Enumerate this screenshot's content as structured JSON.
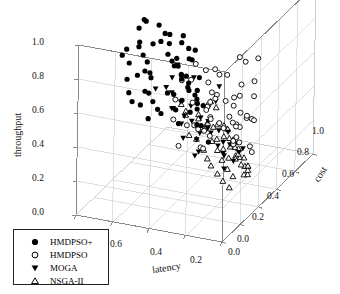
{
  "figure": {
    "type": "3d-scatter",
    "background": "#ffffff",
    "frame_color": "#8a8a8a",
    "point_color": "#000000"
  },
  "axes": {
    "y": {
      "label": "throughput",
      "ticks": [
        "0.0",
        "0.2",
        "0.4",
        "0.6",
        "0.8",
        "1.0"
      ],
      "range": [
        0,
        1
      ]
    },
    "x": {
      "label": "latency",
      "ticks": [
        "0.8",
        "0.6",
        "0.4",
        "0.2",
        "0.0"
      ],
      "range": [
        0,
        0.8
      ],
      "direction": "descending-left-to-right"
    },
    "z": {
      "label": "cost",
      "ticks": [
        "0.0",
        "0.2",
        "0.4",
        "0.6",
        "0.8",
        "1.0"
      ],
      "range": [
        0,
        1
      ]
    }
  },
  "legend": {
    "items": [
      {
        "label": "HMDPSO+",
        "marker": "filled-circle"
      },
      {
        "label": "HMDPSO",
        "marker": "open-circle"
      },
      {
        "label": "MOGA",
        "marker": "filled-triangle-down"
      },
      {
        "label": "NSGA-II",
        "marker": "open-triangle-up"
      }
    ]
  },
  "chart_data": {
    "type": "scatter",
    "title": "",
    "xlabel": "latency",
    "ylabel": "throughput",
    "zlabel": "cost",
    "xlim": [
      0,
      0.8
    ],
    "ylim": [
      0,
      1
    ],
    "zlim": [
      0,
      1
    ],
    "grid": true,
    "legend_position": "lower-left",
    "series": [
      {
        "name": "HMDPSO+",
        "marker": "filled-circle",
        "points": [
          [
            0.62,
            0.98,
            0.3
          ],
          [
            0.55,
            0.97,
            0.38
          ],
          [
            0.48,
            0.95,
            0.26
          ],
          [
            0.66,
            0.93,
            0.46
          ],
          [
            0.58,
            0.92,
            0.22
          ],
          [
            0.41,
            0.91,
            0.35
          ],
          [
            0.7,
            0.9,
            0.52
          ],
          [
            0.52,
            0.89,
            0.44
          ],
          [
            0.63,
            0.88,
            0.33
          ],
          [
            0.45,
            0.87,
            0.28
          ],
          [
            0.57,
            0.86,
            0.49
          ],
          [
            0.36,
            0.85,
            0.4
          ],
          [
            0.68,
            0.84,
            0.24
          ],
          [
            0.5,
            0.83,
            0.55
          ],
          [
            0.6,
            0.82,
            0.31
          ],
          [
            0.43,
            0.81,
            0.47
          ],
          [
            0.72,
            0.8,
            0.37
          ],
          [
            0.54,
            0.79,
            0.21
          ],
          [
            0.64,
            0.78,
            0.5
          ],
          [
            0.47,
            0.77,
            0.42
          ],
          [
            0.38,
            0.76,
            0.29
          ],
          [
            0.59,
            0.75,
            0.58
          ],
          [
            0.69,
            0.74,
            0.34
          ],
          [
            0.51,
            0.73,
            0.45
          ],
          [
            0.61,
            0.72,
            0.27
          ],
          [
            0.44,
            0.71,
            0.53
          ],
          [
            0.33,
            0.7,
            0.39
          ],
          [
            0.56,
            0.69,
            0.32
          ],
          [
            0.66,
            0.68,
            0.48
          ],
          [
            0.49,
            0.67,
            0.6
          ],
          [
            0.4,
            0.66,
            0.25
          ],
          [
            0.62,
            0.65,
            0.43
          ],
          [
            0.53,
            0.64,
            0.56
          ],
          [
            0.71,
            0.63,
            0.36
          ],
          [
            0.46,
            0.62,
            0.51
          ],
          [
            0.35,
            0.61,
            0.41
          ],
          [
            0.58,
            0.6,
            0.62
          ],
          [
            0.67,
            0.59,
            0.3
          ],
          [
            0.5,
            0.58,
            0.54
          ],
          [
            0.42,
            0.57,
            0.46
          ],
          [
            0.6,
            0.56,
            0.38
          ],
          [
            0.31,
            0.55,
            0.33
          ],
          [
            0.55,
            0.54,
            0.64
          ],
          [
            0.65,
            0.53,
            0.44
          ],
          [
            0.48,
            0.52,
            0.57
          ],
          [
            0.39,
            0.51,
            0.49
          ],
          [
            0.63,
            0.5,
            0.35
          ],
          [
            0.52,
            0.49,
            0.66
          ],
          [
            0.7,
            0.48,
            0.4
          ],
          [
            0.45,
            0.47,
            0.59
          ],
          [
            0.37,
            0.46,
            0.52
          ],
          [
            0.57,
            0.45,
            0.42
          ],
          [
            0.28,
            0.62,
            0.27
          ],
          [
            0.3,
            0.47,
            0.31
          ],
          [
            0.61,
            0.44,
            0.61
          ],
          [
            0.5,
            0.43,
            0.48
          ],
          [
            0.43,
            0.42,
            0.37
          ],
          [
            0.66,
            0.41,
            0.55
          ],
          [
            0.54,
            0.4,
            0.63
          ],
          [
            0.34,
            0.39,
            0.44
          ],
          [
            0.59,
            0.38,
            0.5
          ],
          [
            0.47,
            0.37,
            0.58
          ],
          [
            0.26,
            0.35,
            0.36
          ],
          [
            0.64,
            0.36,
            0.46
          ]
        ]
      },
      {
        "name": "HMDPSO",
        "marker": "open-circle",
        "points": [
          [
            0.24,
            0.64,
            0.72
          ],
          [
            0.31,
            0.58,
            0.66
          ],
          [
            0.2,
            0.52,
            0.58
          ],
          [
            0.27,
            0.49,
            0.74
          ],
          [
            0.35,
            0.47,
            0.63
          ],
          [
            0.18,
            0.44,
            0.55
          ],
          [
            0.29,
            0.43,
            0.7
          ],
          [
            0.38,
            0.42,
            0.6
          ],
          [
            0.22,
            0.41,
            0.78
          ],
          [
            0.33,
            0.4,
            0.52
          ],
          [
            0.41,
            0.39,
            0.68
          ],
          [
            0.26,
            0.38,
            0.59
          ],
          [
            0.36,
            0.37,
            0.75
          ],
          [
            0.19,
            0.36,
            0.64
          ],
          [
            0.3,
            0.35,
            0.56
          ],
          [
            0.44,
            0.34,
            0.71
          ],
          [
            0.23,
            0.33,
            0.61
          ],
          [
            0.34,
            0.32,
            0.8
          ],
          [
            0.4,
            0.31,
            0.53
          ],
          [
            0.28,
            0.3,
            0.67
          ],
          [
            0.47,
            0.29,
            0.76
          ],
          [
            0.21,
            0.28,
            0.57
          ],
          [
            0.32,
            0.27,
            0.65
          ],
          [
            0.43,
            0.26,
            0.73
          ],
          [
            0.25,
            0.25,
            0.82
          ],
          [
            0.37,
            0.24,
            0.6
          ],
          [
            0.5,
            0.23,
            0.69
          ],
          [
            0.29,
            0.22,
            0.77
          ],
          [
            0.16,
            0.21,
            0.62
          ],
          [
            0.39,
            0.2,
            0.54
          ],
          [
            0.46,
            0.19,
            0.72
          ],
          [
            0.27,
            0.18,
            0.66
          ],
          [
            0.35,
            0.17,
            0.85
          ],
          [
            0.53,
            0.16,
            0.58
          ],
          [
            0.31,
            0.15,
            0.74
          ],
          [
            0.42,
            0.14,
            0.63
          ],
          [
            0.12,
            0.46,
            0.5
          ],
          [
            0.14,
            0.32,
            0.46
          ],
          [
            0.1,
            0.24,
            0.52
          ],
          [
            0.48,
            0.35,
            0.84
          ],
          [
            0.56,
            0.3,
            0.79
          ],
          [
            0.6,
            0.26,
            0.66
          ],
          [
            0.52,
            0.38,
            0.88
          ],
          [
            0.45,
            0.45,
            0.86
          ],
          [
            0.58,
            0.42,
            0.81
          ],
          [
            0.63,
            0.33,
            0.74
          ],
          [
            0.49,
            0.28,
            0.9
          ],
          [
            0.55,
            0.21,
            0.71
          ],
          [
            0.17,
            0.56,
            0.68
          ],
          [
            0.13,
            0.38,
            0.6
          ],
          [
            0.66,
            0.37,
            0.87
          ],
          [
            0.61,
            0.45,
            0.92
          ],
          [
            0.23,
            0.6,
            0.84
          ],
          [
            0.36,
            0.55,
            0.9
          ],
          [
            0.44,
            0.52,
            0.79
          ],
          [
            0.51,
            0.48,
            0.83
          ]
        ]
      },
      {
        "name": "MOGA",
        "marker": "filled-triangle-down",
        "points": [
          [
            0.7,
            0.42,
            0.66
          ],
          [
            0.64,
            0.38,
            0.72
          ],
          [
            0.58,
            0.36,
            0.6
          ],
          [
            0.52,
            0.34,
            0.69
          ],
          [
            0.46,
            0.32,
            0.58
          ],
          [
            0.4,
            0.3,
            0.64
          ],
          [
            0.34,
            0.29,
            0.55
          ],
          [
            0.28,
            0.27,
            0.62
          ],
          [
            0.22,
            0.26,
            0.52
          ],
          [
            0.61,
            0.31,
            0.76
          ],
          [
            0.55,
            0.28,
            0.68
          ],
          [
            0.49,
            0.25,
            0.74
          ],
          [
            0.43,
            0.24,
            0.61
          ],
          [
            0.37,
            0.22,
            0.7
          ],
          [
            0.31,
            0.21,
            0.57
          ],
          [
            0.25,
            0.19,
            0.66
          ],
          [
            0.19,
            0.18,
            0.5
          ],
          [
            0.67,
            0.24,
            0.8
          ],
          [
            0.59,
            0.2,
            0.73
          ],
          [
            0.53,
            0.18,
            0.63
          ],
          [
            0.47,
            0.17,
            0.78
          ],
          [
            0.41,
            0.16,
            0.56
          ],
          [
            0.35,
            0.15,
            0.71
          ],
          [
            0.29,
            0.14,
            0.6
          ],
          [
            0.73,
            0.33,
            0.84
          ],
          [
            0.69,
            0.45,
            0.88
          ],
          [
            0.63,
            0.48,
            0.7
          ],
          [
            0.57,
            0.43,
            0.82
          ],
          [
            0.15,
            0.25,
            0.48
          ],
          [
            0.11,
            0.3,
            0.44
          ],
          [
            0.45,
            0.38,
            0.86
          ],
          [
            0.38,
            0.4,
            0.68
          ],
          [
            0.5,
            0.13,
            0.72
          ],
          [
            0.44,
            0.12,
            0.58
          ],
          [
            0.33,
            0.11,
            0.67
          ],
          [
            0.26,
            0.1,
            0.54
          ]
        ]
      },
      {
        "name": "NSGA-II",
        "marker": "open-triangle-up",
        "points": [
          [
            0.4,
            0.14,
            0.86
          ],
          [
            0.34,
            0.12,
            0.8
          ],
          [
            0.28,
            0.11,
            0.74
          ],
          [
            0.22,
            0.1,
            0.68
          ],
          [
            0.17,
            0.09,
            0.62
          ],
          [
            0.45,
            0.12,
            0.92
          ],
          [
            0.38,
            0.1,
            0.84
          ],
          [
            0.32,
            0.09,
            0.78
          ],
          [
            0.26,
            0.08,
            0.71
          ],
          [
            0.2,
            0.07,
            0.65
          ],
          [
            0.5,
            0.1,
            0.95
          ],
          [
            0.43,
            0.08,
            0.88
          ],
          [
            0.36,
            0.07,
            0.81
          ],
          [
            0.3,
            0.06,
            0.75
          ],
          [
            0.24,
            0.05,
            0.69
          ],
          [
            0.18,
            0.05,
            0.6
          ],
          [
            0.55,
            0.09,
            0.9
          ],
          [
            0.47,
            0.07,
            0.83
          ],
          [
            0.41,
            0.06,
            0.77
          ],
          [
            0.35,
            0.05,
            0.7
          ],
          [
            0.29,
            0.04,
            0.64
          ],
          [
            0.23,
            0.04,
            0.58
          ],
          [
            0.6,
            0.12,
            0.94
          ],
          [
            0.52,
            0.14,
            0.87
          ],
          [
            0.14,
            0.08,
            0.56
          ],
          [
            0.12,
            0.13,
            0.52
          ],
          [
            0.1,
            0.18,
            0.48
          ],
          [
            0.58,
            0.17,
            0.9
          ],
          [
            0.63,
            0.2,
            0.86
          ],
          [
            0.48,
            0.19,
            0.8
          ],
          [
            0.42,
            0.21,
            0.74
          ],
          [
            0.37,
            0.18,
            0.68
          ],
          [
            0.31,
            0.16,
            0.63
          ],
          [
            0.25,
            0.15,
            0.57
          ],
          [
            0.66,
            0.14,
            0.92
          ],
          [
            0.56,
            0.06,
            0.84
          ],
          [
            0.49,
            0.04,
            0.78
          ],
          [
            0.44,
            0.03,
            0.72
          ],
          [
            0.39,
            0.03,
            0.66
          ],
          [
            0.33,
            0.02,
            0.61
          ],
          [
            0.27,
            0.02,
            0.55
          ],
          [
            0.21,
            0.02,
            0.5
          ],
          [
            0.62,
            0.05,
            0.88
          ],
          [
            0.7,
            0.18,
            0.95
          ],
          [
            0.16,
            0.22,
            0.46
          ],
          [
            0.13,
            0.27,
            0.43
          ],
          [
            0.53,
            0.24,
            0.93
          ],
          [
            0.46,
            0.26,
            0.85
          ]
        ]
      }
    ]
  }
}
